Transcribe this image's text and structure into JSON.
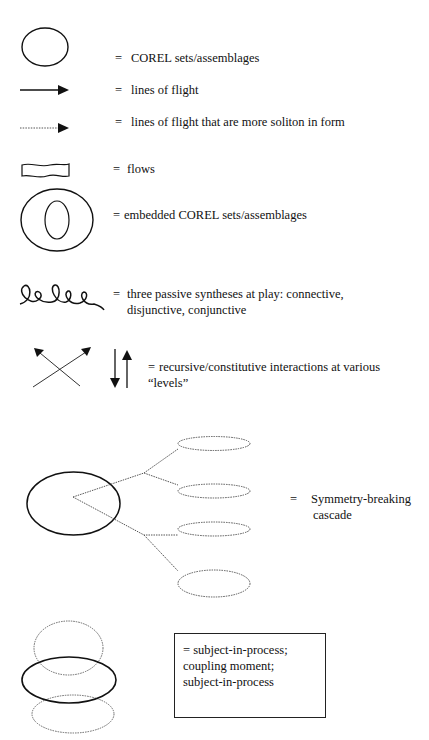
{
  "legend": [
    {
      "symbol": "ellipse-icon",
      "equals": "=",
      "text": "COREL sets/assemblages"
    },
    {
      "symbol": "solid-arrow-icon",
      "equals": "=",
      "text": "lines of flight"
    },
    {
      "symbol": "dotted-arrow-icon",
      "equals": "=",
      "text": "lines of flight that are more soliton in form"
    },
    {
      "symbol": "wavy-rectangle-icon",
      "equals": "=",
      "text": "flows"
    },
    {
      "symbol": "nested-ellipse-icon",
      "equals": "=",
      "text": "embedded COREL sets/assemblages"
    },
    {
      "symbol": "loops-icon",
      "equals": "=",
      "text": "three passive syntheses at play: connective,",
      "text2": "disjunctive, conjunctive"
    },
    {
      "symbol": "crossed-arrows-icon",
      "equals": "=",
      "text": "recursive/constitutive interactions at various",
      "text2": "“levels”"
    },
    {
      "symbol": "cascade-icon",
      "equals": "=",
      "text": "Symmetry-breaking",
      "text2": "cascade"
    },
    {
      "symbol": "stacked-ellipses-icon",
      "equals": "=",
      "lines": [
        "subject-in-process;",
        "coupling moment;",
        "subject-in-process"
      ]
    }
  ],
  "colors": {
    "ink": "#111111",
    "background": "#ffffff",
    "dotted": "#555555"
  }
}
